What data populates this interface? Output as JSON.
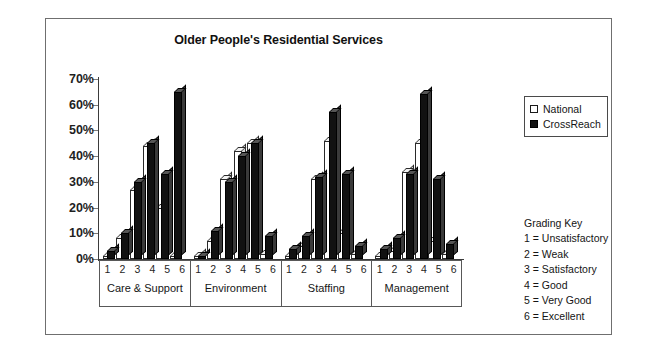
{
  "chart_data": {
    "type": "bar",
    "title": "Older People's Residential Services",
    "xlabel": "",
    "ylabel": "",
    "ylim": [
      0,
      70
    ],
    "ytick_labels": [
      "70%",
      "60%",
      "50%",
      "40%",
      "30%",
      "20%",
      "10%",
      "0%"
    ],
    "ytick_values": [
      70,
      60,
      50,
      40,
      30,
      20,
      10,
      0
    ],
    "grid": false,
    "legend_position": "right-top",
    "unit": "%",
    "categories": [
      "1",
      "2",
      "3",
      "4",
      "5",
      "6"
    ],
    "groups": [
      "Care & Support",
      "Environment",
      "Staffing",
      "Management"
    ],
    "series": [
      {
        "name": "National",
        "color": "#ffffff"
      },
      {
        "name": "CrossReach",
        "color": "#111111"
      }
    ],
    "data": [
      {
        "group": "Care & Support",
        "National": [
          1,
          8,
          27,
          44,
          20,
          1
        ],
        "CrossReach": [
          3,
          10,
          30,
          45,
          33,
          65
        ]
      },
      {
        "group": "Environment",
        "National": [
          1,
          7,
          31,
          42,
          45,
          2
        ],
        "CrossReach": [
          1,
          11,
          30,
          40,
          45,
          9
        ]
      },
      {
        "group": "Staffing",
        "National": [
          1,
          5,
          31,
          46,
          10,
          2
        ],
        "CrossReach": [
          4,
          9,
          32,
          57,
          33,
          5
        ]
      },
      {
        "group": "Management",
        "National": [
          1,
          3,
          34,
          45,
          7,
          2
        ],
        "CrossReach": [
          4,
          8,
          33,
          64,
          31,
          6
        ]
      }
    ]
  },
  "legend": {
    "items": [
      {
        "label": "National",
        "swatch": "open-square-icon"
      },
      {
        "label": "CrossReach",
        "swatch": "filled-square-icon"
      }
    ]
  },
  "grading_key": {
    "title": "Grading Key",
    "rows": [
      "1 = Unsatisfactory",
      "2 = Weak",
      "3 = Satisfactory",
      "4 = Good",
      "5 = Very Good",
      "6 = Excellent"
    ]
  }
}
